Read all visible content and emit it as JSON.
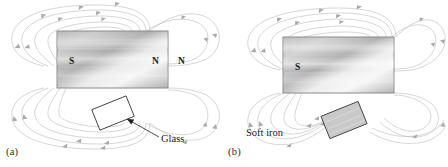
{
  "figure": {
    "background_color": "#ffffff",
    "field_line_color": "#bcbcbc",
    "magnet_outline_color": "#8a8a8a",
    "text_color": "#1a1a1a"
  },
  "panels": [
    {
      "id": "a",
      "caption": "(a)",
      "magnet": {
        "name": "bar-magnet",
        "left_pole_label": "S",
        "right_pole_label": "N",
        "outside_label": "N"
      },
      "object": {
        "name": "glass-block",
        "label": "Glass",
        "fill": "#ffffff",
        "note": "field lines pass straight through, undisturbed"
      }
    },
    {
      "id": "b",
      "caption": "(b)",
      "magnet": {
        "name": "bar-magnet",
        "left_pole_label": "S",
        "right_pole_label": "",
        "outside_label": ""
      },
      "object": {
        "name": "soft-iron-block",
        "label": "Soft iron",
        "fill": "#c9c9c9",
        "note": "field lines are drawn into and concentrated by the iron"
      }
    }
  ]
}
